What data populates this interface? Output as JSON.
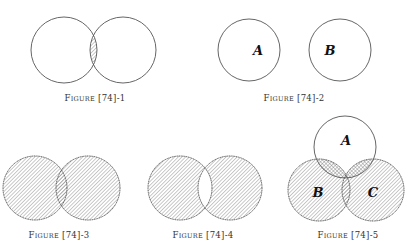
{
  "figures": [
    {
      "caption": "Figure [74]-1",
      "caption_sc": [
        "F",
        "IGURE",
        " [74]-1"
      ],
      "description": "Two overlapping circles; intersection shaded"
    },
    {
      "caption": "Figure [74]-2",
      "caption_sc": [
        "F",
        "IGURE",
        " [74]-2"
      ],
      "labels": [
        "A",
        "B"
      ],
      "description": "Two disjoint circles labeled A and B"
    },
    {
      "caption": "Figure [74]-3",
      "caption_sc": [
        "F",
        "IGURE",
        " [74]-3"
      ],
      "description": "Two overlapping circles; union shaded"
    },
    {
      "caption": "Figure [74]-4",
      "caption_sc": [
        "F",
        "IGURE",
        " [74]-4"
      ],
      "description": "Two overlapping circles; symmetric difference shaded"
    },
    {
      "caption": "Figure [74]-5",
      "caption_sc": [
        "F",
        "IGURE",
        " [74]-5"
      ],
      "labels": [
        "A",
        "B",
        "C"
      ],
      "description": "Three circles A, B, C; B union C shaded, A intersect (B union C) cross-hatched"
    }
  ],
  "colors": {
    "stroke": "#555555",
    "hatch": "#777777",
    "background": "#ffffff"
  }
}
